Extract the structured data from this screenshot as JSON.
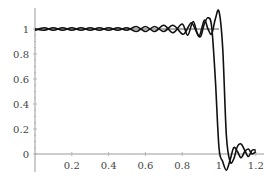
{
  "chart_data": {
    "type": "line",
    "title": "",
    "xlabel": "",
    "ylabel": "",
    "xlim": [
      0,
      1.22
    ],
    "ylim": [
      -0.13,
      1.18
    ],
    "grid": false,
    "legend": null,
    "x_ticks": [
      0.2,
      0.4,
      0.6,
      0.8,
      1,
      1.2
    ],
    "x_tick_labels": [
      "0.2",
      "0.4",
      "0.6",
      "0.8",
      "1",
      "1.2"
    ],
    "y_ticks": [
      0,
      0.2,
      0.4,
      0.6,
      0.8,
      1
    ],
    "y_tick_labels": [
      "0",
      "0.2",
      "0.4",
      "0.6",
      "0.8",
      "1"
    ],
    "reference_line": {
      "y": 1,
      "x_range": [
        0,
        1.0
      ]
    },
    "series": [
      {
        "name": "approximation A (step at x≈1.00)",
        "x": [
          0.0,
          0.05,
          0.1,
          0.15,
          0.2,
          0.25,
          0.3,
          0.35,
          0.4,
          0.45,
          0.5,
          0.55,
          0.6,
          0.65,
          0.7,
          0.75,
          0.8,
          0.82,
          0.85,
          0.88,
          0.9,
          0.92,
          0.94,
          0.96,
          0.98,
          1.0,
          1.02,
          1.04,
          1.06,
          1.08,
          1.1,
          1.12,
          1.14,
          1.16,
          1.18,
          1.2
        ],
        "y": [
          0.99,
          1.01,
          0.99,
          1.01,
          0.99,
          1.01,
          0.99,
          1.01,
          0.99,
          1.01,
          0.99,
          1.02,
          0.98,
          1.02,
          0.98,
          1.03,
          0.96,
          0.98,
          1.05,
          0.97,
          0.94,
          1.04,
          1.09,
          1.02,
          0.6,
          0.05,
          -0.06,
          -0.13,
          -0.05,
          0.05,
          0.02,
          -0.03,
          0.02,
          0.04,
          0.0,
          0.02
        ]
      },
      {
        "name": "approximation B (step at x≈1.03)",
        "x": [
          0.0,
          0.05,
          0.1,
          0.15,
          0.2,
          0.25,
          0.3,
          0.35,
          0.4,
          0.45,
          0.5,
          0.55,
          0.6,
          0.65,
          0.7,
          0.75,
          0.8,
          0.83,
          0.86,
          0.89,
          0.92,
          0.94,
          0.96,
          0.98,
          1.0,
          1.02,
          1.04,
          1.06,
          1.08,
          1.1,
          1.12,
          1.14,
          1.16,
          1.18,
          1.2
        ],
        "y": [
          1.0,
          0.99,
          1.01,
          0.99,
          1.01,
          0.99,
          1.01,
          0.99,
          1.01,
          0.99,
          1.01,
          0.98,
          1.02,
          0.98,
          1.03,
          0.97,
          1.04,
          0.95,
          1.06,
          0.94,
          1.07,
          1.0,
          0.96,
          1.08,
          1.14,
          0.85,
          0.15,
          -0.06,
          -0.04,
          0.06,
          0.08,
          0.03,
          -0.02,
          0.03,
          0.03
        ]
      }
    ]
  }
}
